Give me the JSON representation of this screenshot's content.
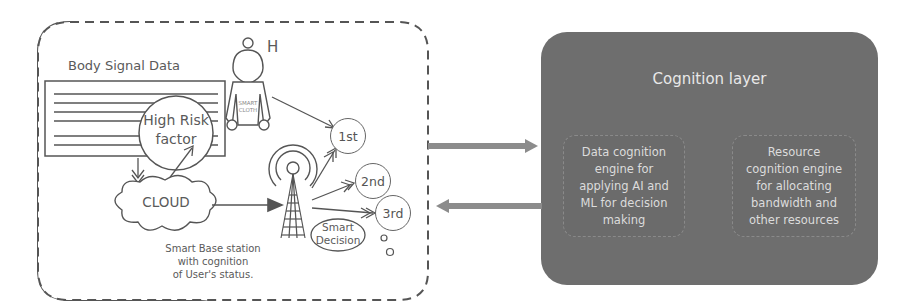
{
  "left_panel": {
    "body_signal_label": "Body Signal Data",
    "user_label": "H",
    "smart_cloth_label": "SMART\nCLOTH",
    "high_risk_label": "High Risk\nfactor",
    "cloud_label": "CLOUD",
    "priorities": [
      "1st",
      "2nd",
      "3rd"
    ],
    "smart_decision_label": "Smart\nDecision",
    "base_station_caption": "Smart Base station\nwith cognition\nof User's status."
  },
  "cognition_layer": {
    "title": "Cognition layer",
    "engines": [
      {
        "label": "Data cognition\nengine for\napplying AI and\nML for decision\nmaking"
      },
      {
        "label": "Resource\ncognition engine\nfor allocating\nbandwidth and\nother resources"
      }
    ]
  },
  "colors": {
    "line": "#555555",
    "cognition_fill": "#6e6e6e",
    "arrow_fill": "#8c8c8c"
  }
}
